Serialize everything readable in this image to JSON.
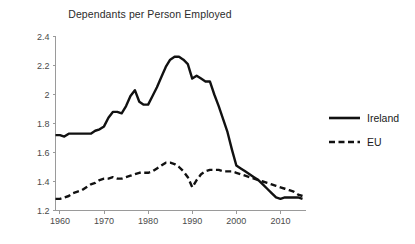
{
  "chart_data": {
    "type": "line",
    "title": "Dependants per Person Employed",
    "xlabel": "",
    "ylabel": "",
    "xlim": [
      1959,
      2015
    ],
    "ylim": [
      1.2,
      2.4
    ],
    "grid": false,
    "legend_position": "right",
    "xticks": [
      "1960",
      "1970",
      "1980",
      "1990",
      "2000",
      "2010"
    ],
    "xtick_values": [
      1960,
      1970,
      1980,
      1990,
      2000,
      2010
    ],
    "yticks": [
      "1.2",
      "1.4",
      "1.6",
      "1.8",
      "2",
      "2.2",
      "2.4"
    ],
    "ytick_values": [
      1.2,
      1.4,
      1.6,
      1.8,
      2.0,
      2.2,
      2.4
    ],
    "x": [
      1959,
      1960,
      1961,
      1962,
      1963,
      1964,
      1965,
      1966,
      1967,
      1968,
      1969,
      1970,
      1971,
      1972,
      1973,
      1974,
      1975,
      1976,
      1977,
      1978,
      1979,
      1980,
      1981,
      1982,
      1983,
      1984,
      1985,
      1986,
      1987,
      1988,
      1989,
      1990,
      1991,
      1992,
      1993,
      1994,
      1995,
      1996,
      1997,
      1998,
      1999,
      2000,
      2001,
      2002,
      2003,
      2004,
      2005,
      2006,
      2007,
      2008,
      2009,
      2010,
      2011,
      2012,
      2013,
      2014,
      2015
    ],
    "series": [
      {
        "name": "Ireland",
        "style": "solid",
        "color": "#111111",
        "values": [
          1.72,
          1.72,
          1.71,
          1.73,
          1.73,
          1.73,
          1.73,
          1.73,
          1.73,
          1.75,
          1.76,
          1.78,
          1.84,
          1.88,
          1.88,
          1.87,
          1.92,
          1.99,
          2.03,
          1.95,
          1.93,
          1.93,
          1.99,
          2.05,
          2.12,
          2.19,
          2.24,
          2.26,
          2.26,
          2.24,
          2.21,
          2.11,
          2.13,
          2.11,
          2.09,
          2.09,
          2.0,
          1.92,
          1.83,
          1.74,
          1.62,
          1.51,
          1.49,
          1.47,
          1.45,
          1.43,
          1.41,
          1.38,
          1.35,
          1.32,
          1.29,
          1.28,
          1.29,
          1.29,
          1.29,
          1.29,
          1.28
        ]
      },
      {
        "name": "EU",
        "style": "dashed",
        "color": "#111111",
        "values": [
          1.28,
          1.28,
          1.29,
          1.3,
          1.32,
          1.33,
          1.34,
          1.36,
          1.38,
          1.39,
          1.41,
          1.42,
          1.42,
          1.43,
          1.42,
          1.42,
          1.43,
          1.44,
          1.45,
          1.46,
          1.46,
          1.46,
          1.47,
          1.49,
          1.51,
          1.53,
          1.53,
          1.52,
          1.5,
          1.47,
          1.43,
          1.36,
          1.41,
          1.45,
          1.47,
          1.48,
          1.48,
          1.48,
          1.47,
          1.47,
          1.47,
          1.46,
          1.45,
          1.44,
          1.43,
          1.42,
          1.41,
          1.4,
          1.39,
          1.38,
          1.37,
          1.36,
          1.35,
          1.34,
          1.33,
          1.31,
          1.3
        ]
      }
    ],
    "legend": [
      {
        "label": "Ireland",
        "style": "solid"
      },
      {
        "label": "EU",
        "style": "dashed"
      }
    ]
  }
}
